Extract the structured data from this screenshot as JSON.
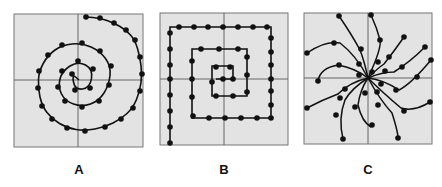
{
  "figure": {
    "panels": [
      {
        "id": "A",
        "label": "A",
        "type": "round spiral (spiral of Archimedes)",
        "box": {
          "x": 14,
          "y": 14,
          "w": 129,
          "h": 133
        },
        "axis_center": {
          "x": 78,
          "y": 80
        },
        "points": [
          [
            79,
            80
          ],
          [
            72,
            74
          ],
          [
            75,
            90
          ],
          [
            90,
            88
          ],
          [
            93,
            69
          ],
          [
            78,
            61
          ],
          [
            62,
            71
          ],
          [
            58,
            87
          ],
          [
            65,
            101
          ],
          [
            82,
            107
          ],
          [
            99,
            101
          ],
          [
            109,
            85
          ],
          [
            111,
            66
          ],
          [
            100,
            51
          ],
          [
            82,
            43
          ],
          [
            62,
            45
          ],
          [
            48,
            55
          ],
          [
            39,
            71
          ],
          [
            38,
            88
          ],
          [
            42,
            106
          ],
          [
            52,
            119
          ],
          [
            67,
            128
          ],
          [
            85,
            131
          ],
          [
            105,
            127
          ],
          [
            121,
            119
          ],
          [
            133,
            108
          ],
          [
            140,
            91
          ],
          [
            142,
            74
          ],
          [
            140,
            57
          ],
          [
            135,
            40
          ],
          [
            126,
            30
          ],
          [
            114,
            23
          ],
          [
            100,
            18
          ],
          [
            86,
            17
          ]
        ]
      },
      {
        "id": "B",
        "label": "B",
        "type": "square spiral",
        "box": {
          "x": 160,
          "y": 13,
          "w": 128,
          "h": 132
        },
        "axis_center": {
          "x": 224,
          "y": 79
        },
        "points": [
          [
            224,
            79
          ],
          [
            216,
            82
          ],
          [
            216,
            68
          ],
          [
            231,
            68
          ],
          [
            231,
            79
          ],
          [
            233,
            96
          ],
          [
            216,
            96
          ],
          [
            199,
            96
          ],
          [
            199,
            79
          ],
          [
            199,
            61
          ],
          [
            219,
            49
          ],
          [
            238,
            49
          ],
          [
            247,
            61
          ],
          [
            247,
            75
          ],
          [
            247,
            91
          ],
          [
            248,
            118
          ],
          [
            230,
            118
          ],
          [
            213,
            118
          ],
          [
            208,
            118
          ],
          [
            193,
            118
          ],
          [
            192,
            118
          ],
          [
            193,
            116
          ],
          [
            192,
            101
          ],
          [
            192,
            79
          ],
          [
            192,
            61
          ],
          [
            192,
            49
          ],
          [
            192,
            49
          ],
          [
            170,
            143
          ],
          [
            170,
            127
          ],
          [
            170,
            111
          ],
          [
            170,
            95
          ],
          [
            170,
            79
          ],
          [
            170,
            65
          ],
          [
            170,
            49
          ],
          [
            170,
            34
          ],
          [
            179,
            27
          ],
          [
            194,
            27
          ],
          [
            208,
            27
          ],
          [
            223,
            27
          ],
          [
            238,
            27
          ],
          [
            253,
            27
          ],
          [
            267,
            27
          ],
          [
            271,
            38
          ],
          [
            271,
            52
          ],
          [
            271,
            65
          ],
          [
            271,
            79
          ],
          [
            271,
            91
          ],
          [
            271,
            105
          ],
          [
            271,
            118
          ],
          [
            257,
            118
          ],
          [
            241,
            118
          ],
          [
            225,
            118
          ],
          [
            209,
            118
          ],
          [
            193,
            118
          ],
          [
            178,
            118
          ]
        ],
        "path_description": "rectangular inward spiral with dots along segments, starting bottom-left and ending near center"
      },
      {
        "id": "C",
        "label": "C",
        "type": "radiating curved spiral arms (pinwheel)",
        "box": {
          "x": 304,
          "y": 13,
          "w": 128,
          "h": 131
        },
        "axis_center": {
          "x": 368,
          "y": 78
        },
        "arms": 10
      }
    ]
  }
}
